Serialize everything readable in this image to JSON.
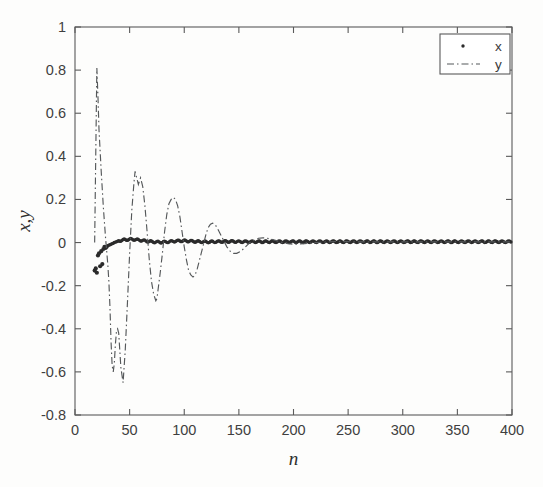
{
  "figure": {
    "background_color": "#fdfdfc",
    "axis_color": "#5a5a5a",
    "series_x_color": "#2b2b2b",
    "series_y_color": "#55585a"
  },
  "axes": {
    "x_title": "n",
    "y_title": "x,y",
    "x_tick_labels": [
      "0",
      "50",
      "100",
      "150",
      "200",
      "250",
      "300",
      "350",
      "400"
    ],
    "y_tick_labels": [
      "1",
      "0.8",
      "0.6",
      "0.4",
      "0.2",
      "0",
      "-0.2",
      "-0.4",
      "-0.6",
      "-0.8"
    ]
  },
  "legend": {
    "entries": [
      {
        "label": "x",
        "marker": "dot-marker"
      },
      {
        "label": "y",
        "marker": "dashdot-line-marker"
      }
    ]
  },
  "chart_data": {
    "type": "line",
    "title": "",
    "xlabel": "n",
    "ylabel": "x,y",
    "xlim": [
      0,
      400
    ],
    "ylim": [
      -0.8,
      1
    ],
    "xticks": [
      0,
      50,
      100,
      150,
      200,
      250,
      300,
      350,
      400
    ],
    "yticks": [
      -0.8,
      -0.6,
      -0.4,
      -0.2,
      0,
      0.2,
      0.4,
      0.6,
      0.8,
      1
    ],
    "grid": false,
    "legend_position": "upper right",
    "series": [
      {
        "name": "x",
        "style": "dots",
        "marker": ".",
        "x": [
          18,
          19,
          20,
          21,
          22,
          23,
          24,
          25,
          26,
          27,
          28,
          29,
          30,
          31,
          32,
          33,
          34,
          35,
          36,
          37,
          38,
          39,
          40,
          42,
          44,
          46,
          48,
          50,
          52,
          55,
          58,
          61,
          64,
          67,
          70,
          73,
          76,
          80,
          84,
          88,
          92,
          96,
          100,
          105,
          110,
          115,
          120,
          125,
          130,
          135,
          140,
          145,
          150,
          160,
          170,
          180,
          190,
          200,
          210,
          220,
          230,
          240,
          250,
          260,
          270,
          280,
          290,
          300,
          310,
          320,
          330,
          340,
          350,
          360,
          370,
          380,
          390,
          400
        ],
        "y": [
          -0.13,
          -0.12,
          -0.14,
          -0.06,
          -0.05,
          -0.11,
          -0.04,
          -0.1,
          -0.03,
          -0.02,
          -0.025,
          -0.02,
          -0.015,
          -0.012,
          -0.01,
          -0.008,
          -0.005,
          -0.003,
          0.0,
          0.002,
          0.004,
          0.006,
          0.008,
          0.01,
          0.012,
          0.013,
          0.014,
          0.015,
          0.015,
          0.014,
          0.012,
          0.01,
          0.008,
          0.006,
          0.004,
          0.003,
          0.002,
          0.002,
          0.003,
          0.005,
          0.007,
          0.008,
          0.008,
          0.007,
          0.005,
          0.004,
          0.003,
          0.003,
          0.004,
          0.005,
          0.005,
          0.005,
          0.004,
          0.004,
          0.004,
          0.004,
          0.004,
          0.004,
          0.004,
          0.004,
          0.004,
          0.004,
          0.004,
          0.004,
          0.004,
          0.004,
          0.004,
          0.004,
          0.004,
          0.004,
          0.004,
          0.004,
          0.004,
          0.004,
          0.004,
          0.004,
          0.004,
          0.004
        ]
      },
      {
        "name": "y",
        "style": "dash-dot",
        "x": [
          18,
          20,
          21,
          22,
          24,
          26,
          28,
          30,
          31,
          32,
          33,
          34,
          35,
          36,
          37,
          38,
          39,
          40,
          41,
          42,
          44,
          46,
          48,
          50,
          52,
          54,
          55,
          56,
          58,
          60,
          62,
          64,
          66,
          68,
          70,
          72,
          74,
          75,
          76,
          78,
          80,
          82,
          84,
          86,
          88,
          90,
          92,
          94,
          96,
          98,
          100,
          102,
          104,
          106,
          108,
          110,
          112,
          115,
          118,
          120,
          122,
          124,
          126,
          128,
          130,
          133,
          136,
          139,
          142,
          145,
          148,
          152,
          156,
          160,
          164,
          168,
          172,
          176,
          180,
          185,
          190,
          195,
          200,
          210,
          220,
          230,
          240,
          250,
          260,
          270,
          280,
          290,
          300,
          320,
          340,
          360,
          380,
          400
        ],
        "y": [
          0.0,
          0.81,
          0.68,
          0.52,
          0.33,
          0.16,
          0.02,
          -0.1,
          -0.18,
          -0.3,
          -0.46,
          -0.57,
          -0.6,
          -0.56,
          -0.47,
          -0.41,
          -0.4,
          -0.42,
          -0.5,
          -0.58,
          -0.65,
          -0.5,
          -0.28,
          -0.05,
          0.15,
          0.28,
          0.33,
          0.31,
          0.27,
          0.3,
          0.26,
          0.17,
          0.05,
          -0.08,
          -0.18,
          -0.24,
          -0.27,
          -0.26,
          -0.22,
          -0.14,
          -0.05,
          0.05,
          0.13,
          0.18,
          0.2,
          0.21,
          0.2,
          0.17,
          0.12,
          0.05,
          -0.02,
          -0.08,
          -0.13,
          -0.15,
          -0.16,
          -0.15,
          -0.12,
          -0.06,
          0.0,
          0.04,
          0.07,
          0.085,
          0.09,
          0.085,
          0.07,
          0.04,
          0.01,
          -0.02,
          -0.04,
          -0.05,
          -0.05,
          -0.04,
          -0.02,
          0.0,
          0.01,
          0.02,
          0.022,
          0.02,
          0.015,
          0.008,
          0.0,
          -0.005,
          -0.008,
          -0.005,
          0.0,
          0.003,
          0.005,
          0.004,
          0.003,
          0.003,
          0.003,
          0.003,
          0.003,
          0.003,
          0.003,
          0.003,
          0.003,
          0.003
        ]
      }
    ]
  }
}
